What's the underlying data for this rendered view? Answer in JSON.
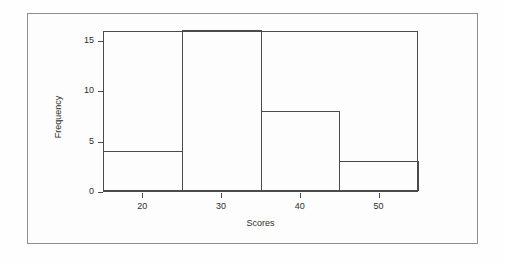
{
  "figure": {
    "background_color": "#fdfdfd",
    "frame_color": "#8e8e8e",
    "axis_color": "#4a4a4a",
    "bar_fill": "none"
  },
  "chart_data": {
    "type": "bar",
    "subtype": "histogram",
    "title": "",
    "xlabel": "Scores",
    "ylabel": "Frequency",
    "categories": [
      "15-25",
      "25-35",
      "35-45",
      "45-55"
    ],
    "bin_edges": [
      15,
      25,
      35,
      45,
      55
    ],
    "values": [
      4,
      16,
      8,
      3
    ],
    "bar_outline_only": true,
    "grid": false,
    "legend": false,
    "xlim": [
      15,
      55
    ],
    "ylim": [
      0,
      16
    ],
    "x_ticks": [
      20,
      30,
      40,
      50
    ],
    "x_tick_labels": [
      "20",
      "30",
      "40",
      "50"
    ],
    "y_ticks": [
      0,
      5,
      10,
      15
    ],
    "y_tick_labels": [
      "0",
      "5",
      "10",
      "15"
    ]
  }
}
